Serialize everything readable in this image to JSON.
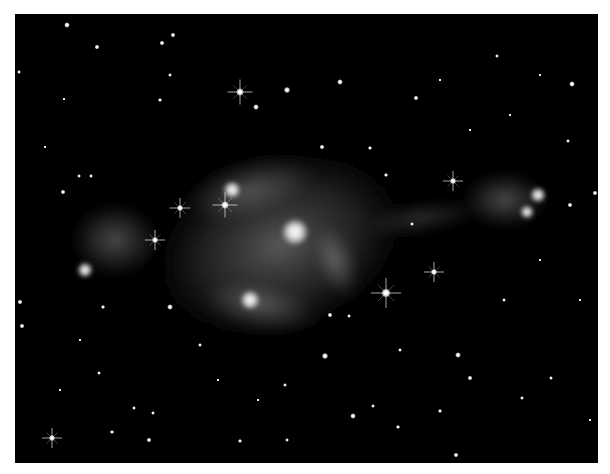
{
  "image": {
    "subject": "bipolar nebula with starfield",
    "palette": {
      "background": "#000000",
      "border": "#ffffff",
      "nebula": "#bfbfbf",
      "star": "#ffffff"
    },
    "frame": {
      "x": 15,
      "y": 14,
      "width": 583,
      "height": 449
    }
  },
  "nebula": {
    "lobes": [
      {
        "name": "central-body",
        "cx": 280,
        "cy": 245,
        "rx": 145,
        "ry": 100,
        "rotate": -20,
        "opacity": 0.45
      },
      {
        "name": "upper-arc",
        "cx": 250,
        "cy": 190,
        "rx": 80,
        "ry": 35,
        "rotate": -15,
        "opacity": 0.35
      },
      {
        "name": "lower-arc",
        "cx": 260,
        "cy": 305,
        "rx": 70,
        "ry": 30,
        "rotate": 10,
        "opacity": 0.35
      },
      {
        "name": "right-arc",
        "cx": 335,
        "cy": 260,
        "rx": 25,
        "ry": 45,
        "rotate": -20,
        "opacity": 0.4
      },
      {
        "name": "west-lobe",
        "cx": 115,
        "cy": 240,
        "rx": 50,
        "ry": 42,
        "rotate": 0,
        "opacity": 0.35
      },
      {
        "name": "east-lobe",
        "cx": 505,
        "cy": 200,
        "rx": 48,
        "ry": 32,
        "rotate": 0,
        "opacity": 0.35
      },
      {
        "name": "east-jet",
        "cx": 420,
        "cy": 218,
        "rx": 70,
        "ry": 18,
        "rotate": -8,
        "opacity": 0.2
      }
    ],
    "bright_knots": [
      {
        "name": "core",
        "cx": 295,
        "cy": 232,
        "r": 14
      },
      {
        "name": "west-knot",
        "cx": 85,
        "cy": 270,
        "r": 8
      },
      {
        "name": "east-knot-1",
        "cx": 538,
        "cy": 195,
        "r": 8
      },
      {
        "name": "east-knot-2",
        "cx": 527,
        "cy": 212,
        "r": 7
      },
      {
        "name": "lower-glow",
        "cx": 250,
        "cy": 300,
        "r": 10
      },
      {
        "name": "upper-glow",
        "cx": 232,
        "cy": 190,
        "r": 9
      }
    ]
  },
  "stars": [
    {
      "x": 240,
      "y": 92,
      "r": 2.5,
      "spikes": true
    },
    {
      "x": 225,
      "y": 205,
      "r": 2.5,
      "spikes": true
    },
    {
      "x": 386,
      "y": 293,
      "r": 3,
      "spikes": true
    },
    {
      "x": 434,
      "y": 272,
      "r": 2,
      "spikes": true
    },
    {
      "x": 453,
      "y": 181,
      "r": 2,
      "spikes": true
    },
    {
      "x": 155,
      "y": 240,
      "r": 2,
      "spikes": true
    },
    {
      "x": 180,
      "y": 208,
      "r": 2,
      "spikes": true
    },
    {
      "x": 52,
      "y": 438,
      "r": 2,
      "spikes": true
    },
    {
      "x": 287,
      "y": 90,
      "r": 2,
      "spikes": false
    },
    {
      "x": 256,
      "y": 107,
      "r": 1.8,
      "spikes": false
    },
    {
      "x": 67,
      "y": 25,
      "r": 1.8,
      "spikes": false
    },
    {
      "x": 97,
      "y": 47,
      "r": 1.5,
      "spikes": false
    },
    {
      "x": 162,
      "y": 43,
      "r": 1.5,
      "spikes": false
    },
    {
      "x": 173,
      "y": 35,
      "r": 1.5,
      "spikes": false
    },
    {
      "x": 170,
      "y": 75,
      "r": 1.2,
      "spikes": false
    },
    {
      "x": 160,
      "y": 100,
      "r": 1.3,
      "spikes": false
    },
    {
      "x": 63,
      "y": 192,
      "r": 1.5,
      "spikes": false
    },
    {
      "x": 79,
      "y": 176,
      "r": 1.2,
      "spikes": false
    },
    {
      "x": 91,
      "y": 176,
      "r": 1.2,
      "spikes": false
    },
    {
      "x": 19,
      "y": 72,
      "r": 1.2,
      "spikes": false
    },
    {
      "x": 45,
      "y": 147,
      "r": 1,
      "spikes": false
    },
    {
      "x": 64,
      "y": 99,
      "r": 1,
      "spikes": false
    },
    {
      "x": 340,
      "y": 82,
      "r": 1.8,
      "spikes": false
    },
    {
      "x": 416,
      "y": 98,
      "r": 1.5,
      "spikes": false
    },
    {
      "x": 572,
      "y": 84,
      "r": 1.8,
      "spikes": false
    },
    {
      "x": 370,
      "y": 148,
      "r": 1.3,
      "spikes": false
    },
    {
      "x": 322,
      "y": 147,
      "r": 1.5,
      "spikes": false
    },
    {
      "x": 386,
      "y": 175,
      "r": 1.3,
      "spikes": false
    },
    {
      "x": 497,
      "y": 56,
      "r": 1.2,
      "spikes": false
    },
    {
      "x": 540,
      "y": 75,
      "r": 1,
      "spikes": false
    },
    {
      "x": 568,
      "y": 141,
      "r": 1.2,
      "spikes": false
    },
    {
      "x": 595,
      "y": 193,
      "r": 1.5,
      "spikes": false
    },
    {
      "x": 570,
      "y": 205,
      "r": 1.5,
      "spikes": false
    },
    {
      "x": 20,
      "y": 302,
      "r": 1.5,
      "spikes": false
    },
    {
      "x": 22,
      "y": 326,
      "r": 1.5,
      "spikes": false
    },
    {
      "x": 103,
      "y": 307,
      "r": 1.3,
      "spikes": false
    },
    {
      "x": 170,
      "y": 307,
      "r": 1.8,
      "spikes": false
    },
    {
      "x": 200,
      "y": 345,
      "r": 1.2,
      "spikes": false
    },
    {
      "x": 99,
      "y": 373,
      "r": 1.2,
      "spikes": false
    },
    {
      "x": 153,
      "y": 413,
      "r": 1.2,
      "spikes": false
    },
    {
      "x": 112,
      "y": 432,
      "r": 1.3,
      "spikes": false
    },
    {
      "x": 149,
      "y": 440,
      "r": 1.5,
      "spikes": false
    },
    {
      "x": 134,
      "y": 408,
      "r": 1.2,
      "spikes": false
    },
    {
      "x": 240,
      "y": 441,
      "r": 1.3,
      "spikes": false
    },
    {
      "x": 287,
      "y": 440,
      "r": 1.2,
      "spikes": false
    },
    {
      "x": 330,
      "y": 315,
      "r": 1.5,
      "spikes": false
    },
    {
      "x": 325,
      "y": 356,
      "r": 2,
      "spikes": false
    },
    {
      "x": 349,
      "y": 316,
      "r": 1.2,
      "spikes": false
    },
    {
      "x": 458,
      "y": 355,
      "r": 1.8,
      "spikes": false
    },
    {
      "x": 470,
      "y": 378,
      "r": 1.5,
      "spikes": false
    },
    {
      "x": 353,
      "y": 416,
      "r": 1.8,
      "spikes": false
    },
    {
      "x": 440,
      "y": 411,
      "r": 1.3,
      "spikes": false
    },
    {
      "x": 398,
      "y": 427,
      "r": 1.3,
      "spikes": false
    },
    {
      "x": 456,
      "y": 455,
      "r": 1.5,
      "spikes": false
    },
    {
      "x": 504,
      "y": 300,
      "r": 1.2,
      "spikes": false
    },
    {
      "x": 551,
      "y": 378,
      "r": 1.2,
      "spikes": false
    },
    {
      "x": 522,
      "y": 398,
      "r": 1.2,
      "spikes": false
    },
    {
      "x": 400,
      "y": 350,
      "r": 1.2,
      "spikes": false
    },
    {
      "x": 373,
      "y": 406,
      "r": 1.2,
      "spikes": false
    },
    {
      "x": 412,
      "y": 224,
      "r": 1.2,
      "spikes": false
    },
    {
      "x": 590,
      "y": 420,
      "r": 1,
      "spikes": false
    },
    {
      "x": 285,
      "y": 385,
      "r": 1.2,
      "spikes": false
    },
    {
      "x": 258,
      "y": 400,
      "r": 1,
      "spikes": false
    },
    {
      "x": 218,
      "y": 380,
      "r": 1,
      "spikes": false
    },
    {
      "x": 80,
      "y": 340,
      "r": 1,
      "spikes": false
    },
    {
      "x": 60,
      "y": 390,
      "r": 1,
      "spikes": false
    },
    {
      "x": 440,
      "y": 80,
      "r": 1,
      "spikes": false
    },
    {
      "x": 470,
      "y": 130,
      "r": 1,
      "spikes": false
    },
    {
      "x": 510,
      "y": 115,
      "r": 1,
      "spikes": false
    },
    {
      "x": 540,
      "y": 260,
      "r": 1,
      "spikes": false
    },
    {
      "x": 580,
      "y": 300,
      "r": 1,
      "spikes": false
    }
  ]
}
